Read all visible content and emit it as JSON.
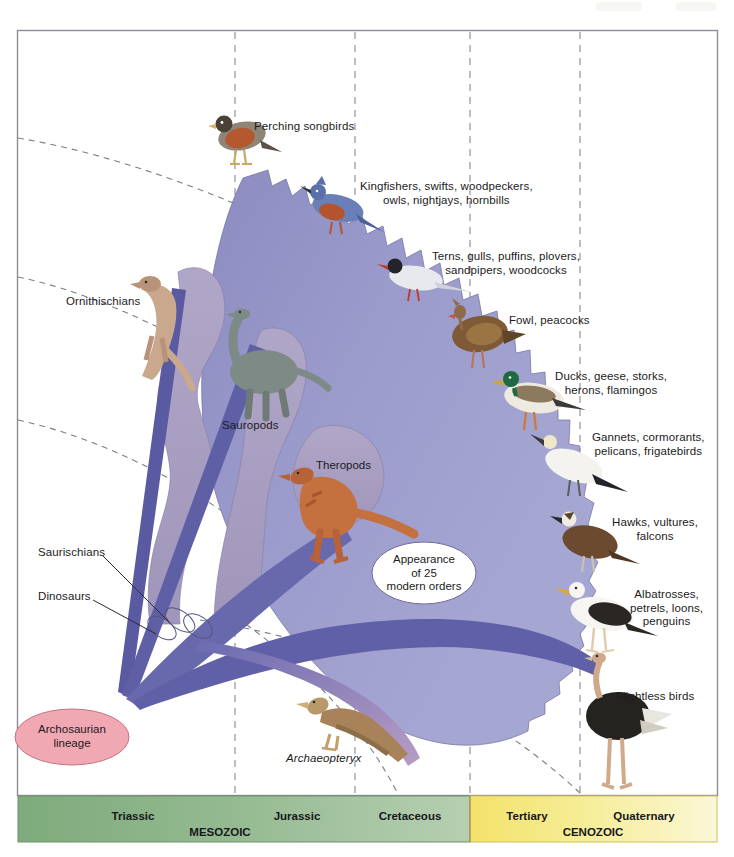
{
  "bird_orders": [
    {
      "id": "perching-songbirds",
      "label": "Perching songbirds"
    },
    {
      "id": "kingfishers",
      "label": "Kingfishers, swifts, woodpeckers,\nowls, nightjays, hornbills"
    },
    {
      "id": "terns",
      "label": "Terns, gulls, puffins, plovers,\nsandpipers, woodcocks"
    },
    {
      "id": "fowl",
      "label": "Fowl, peacocks"
    },
    {
      "id": "ducks",
      "label": "Ducks, geese, storks,\nherons, flamingos"
    },
    {
      "id": "gannets",
      "label": "Gannets, cormorants,\npelicans, frigatebirds"
    },
    {
      "id": "hawks",
      "label": "Hawks, vultures,\nfalcons"
    },
    {
      "id": "albatrosses",
      "label": "Albatrosses,\npetrels, loons,\npenguins"
    },
    {
      "id": "flightless",
      "label": "Flightless birds"
    }
  ],
  "dinosaur_groups": [
    {
      "id": "ornithischians",
      "label": "Ornithischians"
    },
    {
      "id": "sauropods",
      "label": "Sauropods"
    },
    {
      "id": "theropods",
      "label": "Theropods"
    }
  ],
  "lineage_labels": [
    {
      "id": "saurischians",
      "label": "Saurischians"
    },
    {
      "id": "dinosaurs",
      "label": "Dinosaurs"
    }
  ],
  "origin": {
    "label": "Archosaurian\nlineage",
    "color": "#f0a8b2"
  },
  "callout": {
    "label": "Appearance\nof 25\nmodern orders"
  },
  "fossil": {
    "label": "Archaeopteryx"
  },
  "timeline": {
    "eras": [
      {
        "id": "mesozoic",
        "label": "MESOZOIC",
        "color": "#8fb48c"
      },
      {
        "id": "cenozoic",
        "label": "CENOZOIC",
        "color": "#f2e77f"
      }
    ],
    "periods": [
      {
        "id": "triassic",
        "label": "Triassic"
      },
      {
        "id": "jurassic",
        "label": "Jurassic"
      },
      {
        "id": "cretaceous",
        "label": "Cretaceous"
      },
      {
        "id": "tertiary",
        "label": "Tertiary"
      },
      {
        "id": "quaternary",
        "label": "Quaternary"
      }
    ]
  },
  "colors": {
    "bird_fan": "#9a9acb",
    "dino_blob": "#a9a0c0",
    "lineage_wedge": "#5f5fa6",
    "lineage_wedge_dark": "#4a4a8e",
    "frame": "#8d8d95"
  }
}
